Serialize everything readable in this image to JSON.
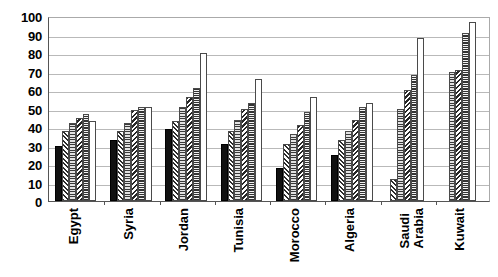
{
  "chart_data": {
    "type": "bar",
    "title": "",
    "subtitle": "",
    "xlabel": "",
    "ylabel": "",
    "ylim": [
      0,
      100
    ],
    "ytick_step": 10,
    "yticks": [
      100,
      90,
      80,
      70,
      60,
      50,
      40,
      30,
      20,
      10,
      0
    ],
    "grid": true,
    "legend": "none",
    "orientation": "vertical",
    "grouped": true,
    "categories": [
      "Egypt",
      "Syria",
      "Jordan",
      "Tunisia",
      "Morocco",
      "Algeria",
      "Saudi Arabia",
      "Kuwait"
    ],
    "series": [
      {
        "name": "Series 1",
        "pattern": "solid-black",
        "values": [
          30,
          33,
          39,
          31,
          18,
          25,
          null,
          null
        ]
      },
      {
        "name": "Series 2",
        "pattern": "diagonal-hatch-up",
        "values": [
          38,
          38,
          43,
          38,
          31,
          33,
          12,
          null
        ]
      },
      {
        "name": "Series 3",
        "pattern": "horizontal-lines",
        "values": [
          42,
          42,
          51,
          44,
          36,
          38,
          50,
          70
        ]
      },
      {
        "name": "Series 4",
        "pattern": "diagonal-hatch-down",
        "values": [
          45,
          49,
          56,
          50,
          41,
          44,
          60,
          71
        ]
      },
      {
        "name": "Series 5",
        "pattern": "horizontal-dense-lines",
        "values": [
          47,
          51,
          61,
          53,
          48,
          51,
          68,
          91
        ]
      },
      {
        "name": "Series 6",
        "pattern": "empty-white",
        "values": [
          43,
          51,
          80,
          66,
          56,
          53,
          88,
          97
        ]
      }
    ]
  },
  "axis": {
    "y_tick_labels": [
      "100",
      "90",
      "80",
      "70",
      "60",
      "50",
      "40",
      "30",
      "20",
      "10",
      "0"
    ],
    "x_tick_labels": [
      "Egypt",
      "Syria",
      "Jordan",
      "Tunisia",
      "Morocco",
      "Algeria",
      "Saudi\nArabia",
      "Kuwait"
    ]
  },
  "colors": {
    "axis": "#555555",
    "gridline": "#b9b9b9",
    "bar_outline": "#4a4a4a",
    "bar_solid": "#111111",
    "background": "#ffffff"
  }
}
